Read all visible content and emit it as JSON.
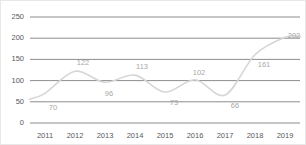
{
  "chart_data": {
    "type": "line",
    "title": "",
    "subtitle": "",
    "xlabel": "",
    "ylabel": "",
    "categories": [
      "2011",
      "2012",
      "2013",
      "2014",
      "2015",
      "2016",
      "2017",
      "2018",
      "2019"
    ],
    "values": [
      70,
      122,
      96,
      113,
      73,
      102,
      66,
      161,
      202
    ],
    "point_labels": [
      "70",
      "122",
      "96",
      "113",
      "73",
      "102",
      "66",
      "161",
      "202"
    ],
    "series": [
      {
        "name": "",
        "values": [
          70,
          122,
          96,
          113,
          73,
          102,
          66,
          161,
          202
        ]
      }
    ],
    "ylim": [
      0,
      250
    ],
    "yticks": [
      0,
      50,
      100,
      150,
      200,
      250
    ],
    "ytick_labels": [
      "0",
      "50",
      "100",
      "150",
      "200",
      "250"
    ],
    "xtick_labels": [
      "2011",
      "2012",
      "2013",
      "2014",
      "2015",
      "2016",
      "2017",
      "2018",
      "2019"
    ],
    "grid": true,
    "grid_axis": "y",
    "legend": false,
    "legend_position": "none",
    "smoothing": "spline",
    "markers": false,
    "annotations": []
  },
  "style": {
    "background_color": "#ffffff",
    "border_color": "#e8e8e8",
    "gridline_color": "#808080",
    "line_color": "#d6d6d6",
    "line_width": 1.6,
    "point_label_color": "#a8a8a8",
    "tick_label_color": "#595959"
  },
  "label_offsets": [
    {
      "dx": 8,
      "dy": 15
    },
    {
      "dx": 8,
      "dy": -8
    },
    {
      "dx": 4,
      "dy": 12
    },
    {
      "dx": 7,
      "dy": -8
    },
    {
      "dx": 9,
      "dy": 11
    },
    {
      "dx": 4,
      "dy": -7
    },
    {
      "dx": 10,
      "dy": 11
    },
    {
      "dx": 9,
      "dy": 10
    },
    {
      "dx": 9,
      "dy": -1
    }
  ]
}
